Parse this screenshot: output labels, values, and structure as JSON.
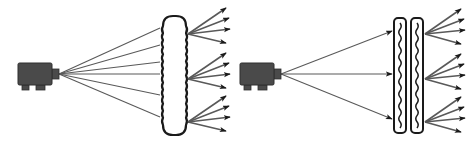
{
  "figure": {
    "title": "",
    "background_color": "#ffffff",
    "width": 472,
    "height": 151
  },
  "colors": {
    "stroke": "#1a1a1a",
    "ray_stroke": "#595959",
    "projector_body": "#4a4a4a",
    "projector_edge": "#2e2e2e",
    "panel_fill": "#ffffff",
    "background": "#ffffff"
  },
  "panels": [
    {
      "id": "left-panel",
      "label": "Thick diffuser illumination diagram",
      "projector": {
        "name": "projector-left",
        "x": 18,
        "y": 63,
        "width": 34,
        "height": 22,
        "nozzle_width": 7,
        "nozzle_height": 10,
        "feet": [
          {
            "x": 22,
            "y": 85,
            "width": 7,
            "height": 5
          },
          {
            "x": 36,
            "y": 85,
            "width": 9,
            "height": 5
          }
        ],
        "emitter_x": 59,
        "emitter_y": 74
      },
      "diffuser": {
        "name": "thick-diffuser",
        "type": "scalloped-rounded-rect",
        "x": 163,
        "y": 16,
        "width": 23,
        "height": 119,
        "corner_radius": 10,
        "wave_count": 14,
        "wave_amplitude": 2.1,
        "stroke_width": 2.2
      },
      "incident_rays": {
        "name": "incident-ray-fan-left",
        "count": 6,
        "arrowheads": false,
        "origin": [
          59,
          74
        ],
        "end_x": 160,
        "end_y_values": [
          28,
          45,
          62,
          74,
          95,
          117
        ]
      },
      "output_groups": [
        {
          "name": "scatter-fan-top",
          "origin": [
            188,
            34
          ],
          "arrows": [
            {
              "dx": 38,
              "dy": -26
            },
            {
              "dx": 41,
              "dy": -16
            },
            {
              "dx": 42,
              "dy": -5
            },
            {
              "dx": 38,
              "dy": 9
            }
          ]
        },
        {
          "name": "scatter-fan-middle",
          "origin": [
            188,
            79
          ],
          "arrows": [
            {
              "dx": 38,
              "dy": -26
            },
            {
              "dx": 41,
              "dy": -16
            },
            {
              "dx": 42,
              "dy": -5
            },
            {
              "dx": 38,
              "dy": 9
            }
          ]
        },
        {
          "name": "scatter-fan-bottom",
          "origin": [
            188,
            122
          ],
          "arrows": [
            {
              "dx": 38,
              "dy": -26
            },
            {
              "dx": 41,
              "dy": -16
            },
            {
              "dx": 42,
              "dy": -5
            },
            {
              "dx": 38,
              "dy": 9
            }
          ]
        }
      ]
    },
    {
      "id": "right-panel",
      "label": "Dual thin diffuser illumination diagram",
      "projector": {
        "name": "projector-right",
        "x": 240,
        "y": 63,
        "width": 34,
        "height": 22,
        "nozzle_width": 7,
        "nozzle_height": 10,
        "feet": [
          {
            "x": 244,
            "y": 85,
            "width": 7,
            "height": 5
          },
          {
            "x": 258,
            "y": 85,
            "width": 9,
            "height": 5
          }
        ],
        "emitter_x": 281,
        "emitter_y": 74
      },
      "diffusers": [
        {
          "name": "thin-diffuser-first",
          "type": "thin-wavy-panel",
          "x": 394,
          "y": 18,
          "width": 12,
          "height": 115,
          "corner_radius": 4,
          "wave_count": 17,
          "wave_amplitude": 2.4,
          "stroke_width": 2.0
        },
        {
          "name": "thin-diffuser-second",
          "type": "thin-wavy-panel",
          "x": 411,
          "y": 18,
          "width": 12,
          "height": 115,
          "corner_radius": 4,
          "wave_count": 17,
          "wave_amplitude": 2.4,
          "stroke_width": 2.0
        }
      ],
      "incident_rays": {
        "name": "incident-ray-fan-right",
        "count": 3,
        "arrowheads": true,
        "origin": [
          281,
          74
        ],
        "end_x": 392,
        "end_y_values": [
          31,
          74,
          119
        ]
      },
      "output_groups": [
        {
          "name": "scatter-fan-top",
          "origin": [
            425,
            34
          ],
          "arrows": [
            {
              "dx": 36,
              "dy": -25
            },
            {
              "dx": 39,
              "dy": -15
            },
            {
              "dx": 40,
              "dy": -4
            },
            {
              "dx": 36,
              "dy": 10
            }
          ]
        },
        {
          "name": "scatter-fan-middle",
          "origin": [
            425,
            79
          ],
          "arrows": [
            {
              "dx": 36,
              "dy": -25
            },
            {
              "dx": 39,
              "dy": -15
            },
            {
              "dx": 40,
              "dy": -4
            },
            {
              "dx": 36,
              "dy": 10
            }
          ]
        },
        {
          "name": "scatter-fan-bottom",
          "origin": [
            425,
            122
          ],
          "arrows": [
            {
              "dx": 36,
              "dy": -25
            },
            {
              "dx": 39,
              "dy": -15
            },
            {
              "dx": 40,
              "dy": -4
            },
            {
              "dx": 36,
              "dy": 10
            }
          ]
        }
      ]
    }
  ]
}
